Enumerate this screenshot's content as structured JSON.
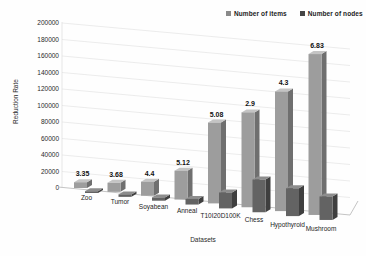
{
  "chart_data": {
    "type": "bar",
    "projection": "3d",
    "title": "",
    "xlabel": "Datasets",
    "ylabel": "Reduction Rate",
    "ylim": [
      0,
      200000
    ],
    "ytick_step": 20000,
    "ytick_labels": [
      "0",
      "20000",
      "40000",
      "60000",
      "80000",
      "100000",
      "120000",
      "140000",
      "160000",
      "180000",
      "200000"
    ],
    "grid": true,
    "legend_position": "top-right",
    "categories": [
      "Zoo",
      "Tumor",
      "Soyabean",
      "Anneal",
      "T10I20D100K",
      "Chess",
      "Hypothyroid",
      "Mushroom"
    ],
    "series": [
      {
        "name": "Number of items",
        "values": [
          7000,
          11000,
          17000,
          35000,
          98000,
          115000,
          145000,
          195000
        ],
        "color_front": "#9d9d9d",
        "color_top": "#c4c4c4",
        "color_side": "#6f6f6f",
        "marker_color": "#8a8a8a"
      },
      {
        "name": "Number of nodes",
        "values": [
          2100,
          3000,
          3900,
          6800,
          19300,
          39700,
          33700,
          28500
        ],
        "color_front": "#636363",
        "color_top": "#8d8d8d",
        "color_side": "#3f3f3f",
        "marker_color": "#454545"
      }
    ],
    "bar_labels": [
      "3.35",
      "3.68",
      "4.4",
      "5.12",
      "5.08",
      "2.9",
      "4.3",
      "6.83"
    ],
    "gridline_color": "#e4e4e4",
    "axis_line_color": "#bdbdbd"
  }
}
